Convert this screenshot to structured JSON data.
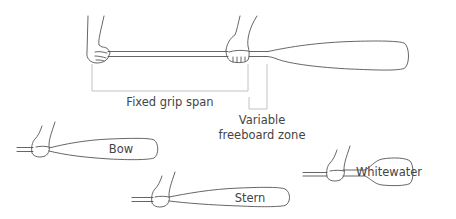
{
  "diagram": {
    "main_paddle": {
      "dimensions": {
        "fixed_grip_span": "Fixed grip span",
        "variable_line1": "Variable",
        "variable_line2": "freeboard zone"
      }
    },
    "paddle_variants": [
      {
        "id": "bow",
        "label": "Bow"
      },
      {
        "id": "stern",
        "label": "Stern"
      },
      {
        "id": "whitewater",
        "label": "Whitewater"
      }
    ],
    "colors": {
      "stroke": "#555555",
      "dimension_line": "#bbbbbb",
      "text": "#444444",
      "background": "#ffffff"
    }
  }
}
